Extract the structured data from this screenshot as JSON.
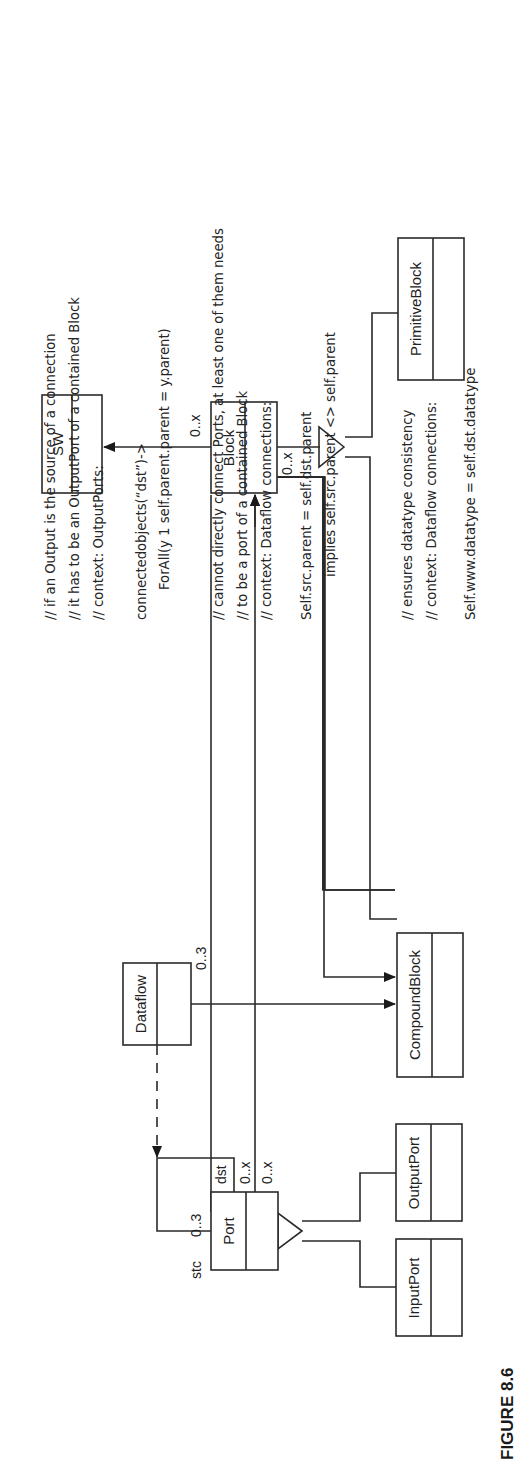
{
  "figure": {
    "label": "FIGURE 8.6"
  },
  "classes": {
    "sw": "SW",
    "block": "Block",
    "primitive_block": "PrimitiveBlock",
    "compound_block": "CompoundBlock",
    "dataflow": "Dataflow",
    "port": "Port",
    "output_port": "OutputPort",
    "input_port": "InputPort"
  },
  "multiplicities": {
    "block_to_sw": "0..x",
    "block_to_compound": "0..x",
    "dataflow_to_compound": "0..3",
    "port_src": "0..3",
    "port_dst": "0..x",
    "port_to_block": "0..x"
  },
  "roles": {
    "src": "stc",
    "dst": "dst"
  },
  "constraints": [
    {
      "comments": [
        "// if an Output is the source of a connection",
        "// it has to be an OutputPort of a contained Block",
        "// context: OutputPorts:"
      ],
      "code": [
        "connectedobjects(“dst”)->",
        "ForAll(y 1 self.parent.parent = y.parent)"
      ]
    },
    {
      "comments": [
        "// cannot directly connect Ports, at least one of them needs",
        "// to be a port of a contained Block",
        "// context: Dataflow connections:"
      ],
      "code": [
        "Self.src.parent = self.dst.parent",
        "implies self.src.parent <> self.parent"
      ]
    },
    {
      "comments": [
        "// ensures datatype consistency",
        "// context: Dataflow connections:"
      ],
      "code": [
        "Self.www.datatype = self.dst.datatype"
      ]
    }
  ]
}
